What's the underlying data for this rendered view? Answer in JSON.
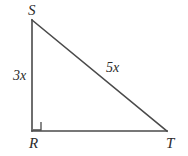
{
  "figure": {
    "type": "right-triangle-diagram",
    "background_color": "#ffffff",
    "stroke_color": "#4a4a4a",
    "text_color": "#2b2b2b",
    "vertices": {
      "s": {
        "label": "S",
        "x": 32,
        "y": 20
      },
      "r": {
        "label": "R",
        "x": 32,
        "y": 131
      },
      "t": {
        "label": "T",
        "x": 167,
        "y": 131
      }
    },
    "sides": {
      "leg_vertical": {
        "label": "3x",
        "from": "S",
        "to": "R"
      },
      "hypotenuse": {
        "label": "5x",
        "from": "S",
        "to": "T"
      },
      "leg_horizontal": {
        "label": "",
        "from": "R",
        "to": "T"
      }
    },
    "right_angle": {
      "at_vertex": "R",
      "marker": "square",
      "size": 8
    }
  }
}
